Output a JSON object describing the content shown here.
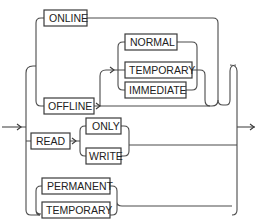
{
  "diagram": {
    "type": "railroad-syntax",
    "nodes": {
      "online": "ONLINE",
      "offline": "OFFLINE",
      "normal": "NORMAL",
      "temporary_offline": "TEMPORARY",
      "immediate": "IMMEDIATE",
      "read": "READ",
      "only": "ONLY",
      "write": "WRITE",
      "permanent": "PERMANENT",
      "temporary": "TEMPORARY"
    },
    "colors": {
      "line": "#4a4a4a",
      "box_border": "#3a3a3a",
      "text": "#222222",
      "background": "#ffffff"
    }
  }
}
